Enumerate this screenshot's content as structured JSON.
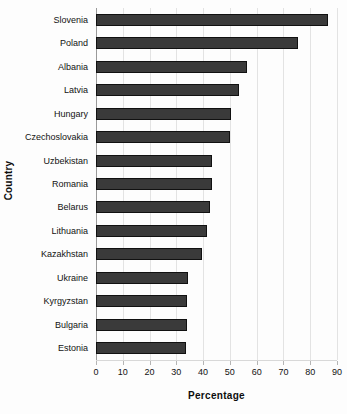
{
  "chart_data": {
    "type": "bar",
    "orientation": "horizontal",
    "title": "",
    "xlabel": "Percentage",
    "ylabel": "Country",
    "xlim": [
      0,
      90
    ],
    "xticks": [
      0,
      10,
      20,
      30,
      40,
      50,
      60,
      70,
      80,
      90
    ],
    "grid": "vertical",
    "legend": "none",
    "bar_color": "#3a3a3a",
    "bar_edge_color": "#111111",
    "categories": [
      "Slovenia",
      "Poland",
      "Albania",
      "Latvia",
      "Hungary",
      "Czechoslovakia",
      "Uzbekistan",
      "Romania",
      "Belarus",
      "Lithuania",
      "Kazakhstan",
      "Ukraine",
      "Kyrgyzstan",
      "Bulgaria",
      "Estonia"
    ],
    "values": [
      86.5,
      75.5,
      56.5,
      53.5,
      50.5,
      50.0,
      43.5,
      43.5,
      42.5,
      41.5,
      39.5,
      34.5,
      34.0,
      34.0,
      33.5
    ]
  }
}
